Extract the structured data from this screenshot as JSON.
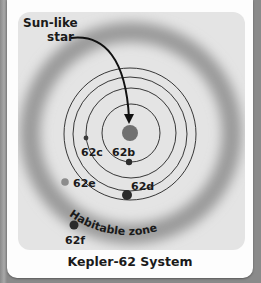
{
  "figure": {
    "caption": "Kepler-62 System",
    "star_label_line1": "Sun-like",
    "star_label_line2": "star",
    "habitable_zone_label": "Habitable zone",
    "planets": [
      {
        "name": "62b",
        "label": "62b"
      },
      {
        "name": "62c",
        "label": "62c"
      },
      {
        "name": "62d",
        "label": "62d"
      },
      {
        "name": "62e",
        "label": "62e"
      },
      {
        "name": "62f",
        "label": "62f"
      }
    ],
    "colors": {
      "background_panel": "#e4e4e4",
      "habitable_zone": "#9a9a9a",
      "star": "#707070",
      "planet_dark": "#2b2b2b",
      "planet_62e": "#8c8c8c",
      "orbit_line": "#222222"
    }
  }
}
